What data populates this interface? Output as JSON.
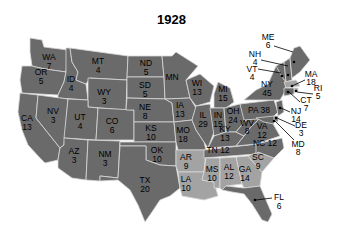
{
  "title": "1928",
  "colors": {
    "winner_a": "#6a6a6a",
    "winner_b": "#a3a3a3",
    "border": "#d8d8d8",
    "background": "#ffffff"
  },
  "legend_note": "dark = majority states, light = other states (no legend shown)",
  "states": {
    "WA": {
      "abbr": "WA",
      "ev": "7",
      "shade": "dark"
    },
    "OR": {
      "abbr": "OR",
      "ev": "5",
      "shade": "dark"
    },
    "CA": {
      "abbr": "CA",
      "ev": "13",
      "shade": "dark"
    },
    "ID": {
      "abbr": "ID",
      "ev": "4",
      "shade": "dark"
    },
    "NV": {
      "abbr": "NV",
      "ev": "3",
      "shade": "dark"
    },
    "MT": {
      "abbr": "MT",
      "ev": "4",
      "shade": "dark"
    },
    "WY": {
      "abbr": "WY",
      "ev": "3",
      "shade": "dark"
    },
    "UT": {
      "abbr": "UT",
      "ev": "4",
      "shade": "dark"
    },
    "AZ": {
      "abbr": "AZ",
      "ev": "3",
      "shade": "dark"
    },
    "CO": {
      "abbr": "CO",
      "ev": "6",
      "shade": "dark"
    },
    "NM": {
      "abbr": "NM",
      "ev": "3",
      "shade": "dark"
    },
    "ND": {
      "abbr": "ND",
      "ev": "5",
      "shade": "dark"
    },
    "SD": {
      "abbr": "SD",
      "ev": "5",
      "shade": "dark"
    },
    "NE": {
      "abbr": "NE",
      "ev": "8",
      "shade": "dark"
    },
    "KS": {
      "abbr": "KS",
      "ev": "10",
      "shade": "dark"
    },
    "OK": {
      "abbr": "OK",
      "ev": "10",
      "shade": "dark"
    },
    "TX": {
      "abbr": "TX",
      "ev": "20",
      "shade": "dark"
    },
    "MN": {
      "abbr": "MN",
      "ev": "12",
      "shade": "dark"
    },
    "IA": {
      "abbr": "IA",
      "ev": "13",
      "shade": "dark"
    },
    "MO": {
      "abbr": "MO",
      "ev": "18",
      "shade": "dark"
    },
    "AR": {
      "abbr": "AR",
      "ev": "9",
      "shade": "light"
    },
    "LA": {
      "abbr": "LA",
      "ev": "10",
      "shade": "light"
    },
    "WI": {
      "abbr": "WI",
      "ev": "13",
      "shade": "dark"
    },
    "IL": {
      "abbr": "IL",
      "ev": "29",
      "shade": "dark"
    },
    "MI": {
      "abbr": "MI",
      "ev": "15",
      "shade": "dark"
    },
    "IN": {
      "abbr": "IN",
      "ev": "15",
      "shade": "dark"
    },
    "OH": {
      "abbr": "OH",
      "ev": "24",
      "shade": "dark"
    },
    "KY": {
      "abbr": "KY",
      "ev": "13",
      "shade": "dark"
    },
    "TN": {
      "abbr": "TN",
      "ev": "12",
      "shade": "dark"
    },
    "MS": {
      "abbr": "MS",
      "ev": "10",
      "shade": "light"
    },
    "AL": {
      "abbr": "AL",
      "ev": "12",
      "shade": "light"
    },
    "GA": {
      "abbr": "GA",
      "ev": "14",
      "shade": "light"
    },
    "FL": {
      "abbr": "FL",
      "ev": "6",
      "shade": "dark"
    },
    "SC": {
      "abbr": "SC",
      "ev": "9",
      "shade": "light"
    },
    "NC": {
      "abbr": "NC",
      "ev": "12",
      "shade": "dark"
    },
    "VA": {
      "abbr": "VA",
      "ev": "12",
      "shade": "dark"
    },
    "WV": {
      "abbr": "WV",
      "ev": "8",
      "shade": "dark"
    },
    "PA": {
      "abbr": "PA",
      "ev": "38",
      "shade": "dark"
    },
    "NY": {
      "abbr": "NY",
      "ev": "45",
      "shade": "dark"
    },
    "VT": {
      "abbr": "VT",
      "ev": "4",
      "shade": "dark"
    },
    "NH": {
      "abbr": "NH",
      "ev": "4",
      "shade": "dark"
    },
    "ME": {
      "abbr": "ME",
      "ev": "6",
      "shade": "dark"
    },
    "MA": {
      "abbr": "MA",
      "ev": "18",
      "shade": "light"
    },
    "RI": {
      "abbr": "RI",
      "ev": "5",
      "shade": "light"
    },
    "CT": {
      "abbr": "CT",
      "ev": "7",
      "shade": "dark"
    },
    "NJ": {
      "abbr": "NJ",
      "ev": "14",
      "shade": "dark"
    },
    "DE": {
      "abbr": "DE",
      "ev": "3",
      "shade": "dark"
    },
    "MD": {
      "abbr": "MD",
      "ev": "8",
      "shade": "dark"
    }
  }
}
